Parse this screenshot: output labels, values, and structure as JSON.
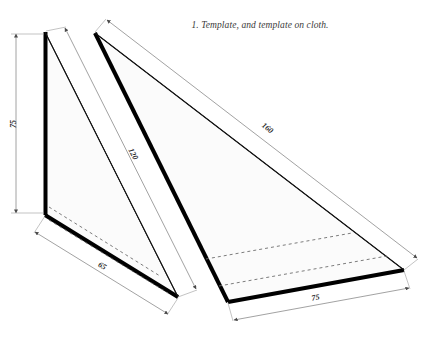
{
  "figure": {
    "caption": "1. Template, and template on cloth.",
    "background_color": "#ffffff",
    "outline_color": "#000000",
    "fill_color": "#fafafa",
    "dimension_line_color": "#8a8a8a",
    "dashed_line_color": "#6d6d6d"
  },
  "dimensions": {
    "left_height": "75",
    "left_base": "65",
    "left_hypotenuse": "120",
    "right_hypotenuse": "160",
    "right_base": "75"
  },
  "shapes": {
    "template": {
      "name": "Template",
      "apex": "45,32",
      "bottom_left": "45,215",
      "bottom_right": "178,297"
    },
    "template_on_cloth": {
      "name": "Template on cloth",
      "apex": "95,33",
      "bottom_left": "228,302",
      "bottom_right": "404,270"
    }
  }
}
